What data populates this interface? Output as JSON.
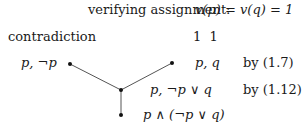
{
  "header": {
    "label": "verifying assignment:",
    "formula": "v(p) = v(q) = 1"
  },
  "left_label": "contradiction",
  "values_row": "1  1",
  "nodes": [
    {
      "formula": "p, ¬p"
    },
    {
      "formula": "p, q",
      "justification": "by (1.7)"
    },
    {
      "formula": "p, ¬p ∨ q",
      "justification": "by (1.12)"
    },
    {
      "formula": "p ∧ (¬p ∨ q)"
    }
  ],
  "colors": {
    "line": "#555555",
    "dot": "#111111"
  }
}
